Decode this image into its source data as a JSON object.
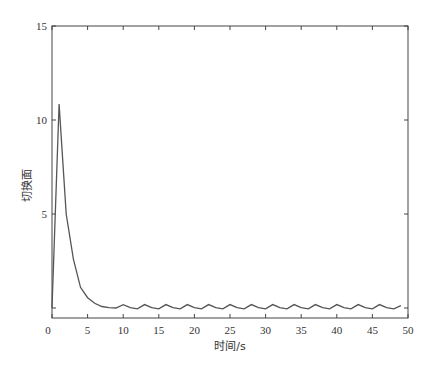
{
  "chart_data": {
    "type": "line",
    "title": "",
    "xlabel": "时间/s",
    "ylabel": "切换面",
    "xlim": [
      0,
      50
    ],
    "ylim": [
      -0.5,
      15
    ],
    "xticks": [
      0,
      5,
      10,
      15,
      20,
      25,
      30,
      35,
      40,
      45,
      50
    ],
    "yticks": [
      0,
      5,
      10,
      15
    ],
    "ytick_labels": [
      "",
      "5",
      "10",
      "15"
    ],
    "grid": false,
    "legend": null,
    "line_color": "#555555",
    "series": [
      {
        "name": "切换面",
        "x": [
          0,
          1,
          2,
          3,
          4,
          5,
          6,
          7,
          8,
          9,
          10,
          11,
          12,
          13,
          14,
          15,
          16,
          17,
          18,
          19,
          20,
          21,
          22,
          23,
          24,
          25,
          26,
          27,
          28,
          29,
          30,
          31,
          32,
          33,
          34,
          35,
          36,
          37,
          38,
          39,
          40,
          41,
          42,
          43,
          44,
          45,
          46,
          47,
          48,
          49
        ],
        "values": [
          0,
          10.85,
          5.0,
          2.6,
          1.1,
          0.55,
          0.25,
          0.08,
          0.02,
          0.0,
          0.18,
          0.02,
          -0.05,
          0.18,
          0.02,
          -0.05,
          0.18,
          0.02,
          -0.05,
          0.18,
          0.02,
          -0.05,
          0.18,
          0.02,
          -0.05,
          0.18,
          0.02,
          -0.05,
          0.18,
          0.02,
          -0.05,
          0.18,
          0.02,
          -0.05,
          0.18,
          0.02,
          -0.05,
          0.18,
          0.02,
          -0.05,
          0.18,
          0.02,
          -0.05,
          0.18,
          0.02,
          -0.05,
          0.18,
          0.02,
          -0.05,
          0.12
        ]
      }
    ]
  }
}
